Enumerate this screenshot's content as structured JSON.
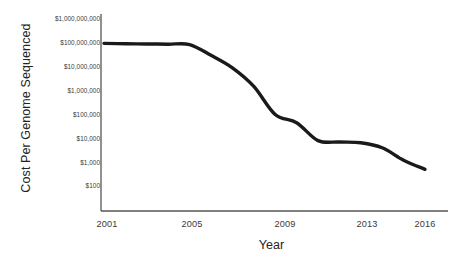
{
  "chart_data": {
    "type": "line",
    "title": "",
    "xlabel": "Year",
    "ylabel": "Cost Per Genome Sequenced",
    "x_tick_labels": [
      "2001",
      "2005",
      "2009",
      "2013",
      "2016"
    ],
    "x_tick_values": [
      2001,
      2005,
      2009,
      2013,
      2016
    ],
    "y_tick_labels": [
      "$1,000,000,000",
      "$100,000,000",
      "$10,000,000",
      "$1,000,000",
      "$100,000",
      "$10,000",
      "$1,000",
      "$100"
    ],
    "y_tick_values": [
      1000000000,
      100000000,
      10000000,
      1000000,
      100000,
      10000,
      1000,
      100
    ],
    "y_scale": "log",
    "xlim": [
      2001,
      2016
    ],
    "ylim": [
      100,
      1000000000
    ],
    "grid": false,
    "legend": false,
    "line_color": "#1a1a1a",
    "axis_color": "#555555",
    "series": [
      {
        "name": "Cost Per Genome Sequenced",
        "x": [
          2001,
          2002,
          2003,
          2004,
          2005,
          2006,
          2007,
          2008,
          2009,
          2010,
          2011,
          2012,
          2013,
          2014,
          2015,
          2016
        ],
        "values": [
          95000000,
          92000000,
          90000000,
          88000000,
          85000000,
          30000000,
          9000000,
          1500000,
          100000,
          45000,
          8000,
          7000,
          6500,
          4000,
          1200,
          500
        ]
      }
    ]
  },
  "axes": {
    "x_title": "Year",
    "y_title": "Cost Per Genome Sequenced"
  }
}
